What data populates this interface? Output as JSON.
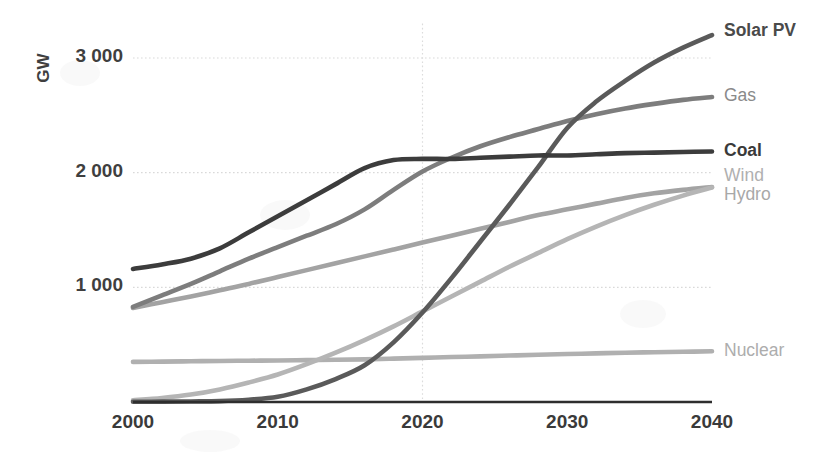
{
  "chart_data": {
    "type": "line",
    "title": "",
    "xlabel": "",
    "ylabel": "GW",
    "xlim": [
      2000,
      2040
    ],
    "ylim": [
      0,
      3300
    ],
    "grid": "horizontal-dotted-plus-2020-vertical",
    "legend_position": "right-of-plot-end-labels",
    "x_ticks": [
      "2000",
      "2010",
      "2020",
      "2030",
      "2040"
    ],
    "x_tick_values": [
      2000,
      2010,
      2020,
      2030,
      2040
    ],
    "y_ticks": [
      "1 000",
      "2 000",
      "3 000"
    ],
    "y_tick_values": [
      1000,
      2000,
      3000
    ],
    "x": [
      2000,
      2002,
      2004,
      2006,
      2008,
      2010,
      2012,
      2014,
      2016,
      2018,
      2020,
      2022,
      2024,
      2026,
      2028,
      2030,
      2032,
      2034,
      2036,
      2038,
      2040
    ],
    "series": [
      {
        "name": "Solar PV",
        "color": "#5a5a5a",
        "label_color": "#4a4a4a",
        "label_bold": true,
        "label_y": 3230,
        "values": [
          2,
          3,
          5,
          8,
          20,
          45,
          110,
          200,
          320,
          520,
          780,
          1080,
          1400,
          1720,
          2050,
          2390,
          2620,
          2800,
          2960,
          3090,
          3200
        ]
      },
      {
        "name": "Gas",
        "color": "#7d7d7d",
        "label_color": "#8a8a8a",
        "label_bold": false,
        "label_y": 2660,
        "values": [
          830,
          930,
          1030,
          1140,
          1250,
          1350,
          1450,
          1550,
          1680,
          1850,
          2010,
          2130,
          2230,
          2310,
          2380,
          2450,
          2510,
          2560,
          2600,
          2635,
          2660
        ]
      },
      {
        "name": "Coal",
        "color": "#3c3c3c",
        "label_color": "#3a3a3a",
        "label_bold": true,
        "label_y": 2180,
        "values": [
          1160,
          1200,
          1250,
          1340,
          1480,
          1620,
          1760,
          1900,
          2040,
          2110,
          2120,
          2120,
          2130,
          2140,
          2150,
          2150,
          2160,
          2170,
          2175,
          2180,
          2185
        ]
      },
      {
        "name": "Wind",
        "color": "#b5b5b5",
        "label_color": "#b0b0b0",
        "label_bold": false,
        "label_y": 1960,
        "values": [
          15,
          35,
          65,
          110,
          170,
          240,
          330,
          430,
          540,
          660,
          790,
          920,
          1050,
          1180,
          1300,
          1420,
          1530,
          1630,
          1720,
          1800,
          1870
        ]
      },
      {
        "name": "Hydro",
        "color": "#a3a3a3",
        "label_color": "#a8a8a8",
        "label_bold": false,
        "label_y": 1800,
        "values": [
          820,
          870,
          920,
          975,
          1030,
          1090,
          1150,
          1210,
          1270,
          1330,
          1390,
          1450,
          1510,
          1570,
          1630,
          1680,
          1730,
          1780,
          1820,
          1850,
          1875
        ]
      },
      {
        "name": "Nuclear",
        "color": "#b0b0b0",
        "label_color": "#adadad",
        "label_bold": false,
        "label_y": 440,
        "values": [
          350,
          352,
          355,
          358,
          360,
          362,
          365,
          368,
          372,
          378,
          385,
          392,
          398,
          405,
          412,
          418,
          424,
          430,
          434,
          438,
          442
        ]
      }
    ]
  }
}
